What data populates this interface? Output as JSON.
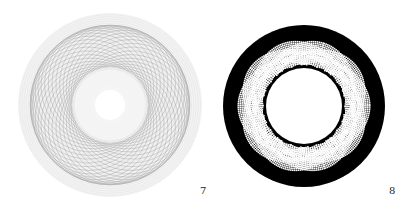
{
  "figures": [
    {
      "label": "7",
      "description": "light gray spirograph-like moire ring pattern",
      "colors": {
        "lines": "#9a9a9a",
        "background": "#ffffff"
      }
    },
    {
      "label": "8",
      "description": "black annulus with white dotted interlaced rosette bands",
      "colors": {
        "ring": "#000000",
        "dots": "#ffffff"
      }
    }
  ]
}
